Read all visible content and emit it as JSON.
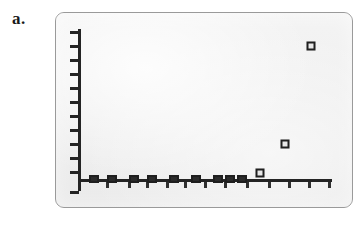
{
  "figure": {
    "panel_label": "a.",
    "background_color": "#ffffff",
    "panel_fill_color": "#ececec",
    "panel_border_color": "#9a9a9a",
    "axis_color": "#242424",
    "marker_color": "#1f1f1f"
  },
  "chart_data": {
    "type": "scatter",
    "title": "",
    "subtitle": "",
    "xlabel": "",
    "ylabel": "",
    "xlim": [
      0,
      10
    ],
    "ylim": [
      0,
      10
    ],
    "grid": false,
    "legend": null,
    "legend_position": "none",
    "x_tick_labels": [],
    "y_tick_labels": [],
    "x_tick_count": 10,
    "y_tick_count": 11,
    "marker_style": "open-square",
    "annotations": [],
    "series": [
      {
        "name": "series-1",
        "x": [
          0.6,
          1.3,
          2.0,
          2.7,
          3.4,
          4.1,
          4.8,
          5.5,
          6.2,
          7.1,
          8.0,
          9.2
        ],
        "y": [
          0.0,
          0.0,
          0.05,
          0.0,
          0.05,
          0.0,
          0.05,
          0.0,
          0.1,
          0.45,
          1.55,
          7.7
        ]
      }
    ],
    "points": [
      {
        "x": 0.6,
        "y": 0.0,
        "px": 38,
        "py": 166,
        "on_axis": true
      },
      {
        "x": 1.3,
        "y": 0.0,
        "px": 56,
        "py": 166,
        "on_axis": true
      },
      {
        "x": 2.0,
        "y": 0.05,
        "px": 78,
        "py": 166,
        "on_axis": true
      },
      {
        "x": 2.7,
        "y": 0.0,
        "px": 96,
        "py": 166,
        "on_axis": true
      },
      {
        "x": 3.4,
        "y": 0.05,
        "px": 118,
        "py": 166,
        "on_axis": true
      },
      {
        "x": 4.1,
        "y": 0.0,
        "px": 140,
        "py": 166,
        "on_axis": true
      },
      {
        "x": 4.8,
        "y": 0.05,
        "px": 162,
        "py": 166,
        "on_axis": true
      },
      {
        "x": 5.5,
        "y": 0.0,
        "px": 174,
        "py": 166,
        "on_axis": true
      },
      {
        "x": 6.2,
        "y": 0.1,
        "px": 186,
        "py": 166,
        "on_axis": true
      },
      {
        "x": 7.1,
        "y": 0.45,
        "px": 204,
        "py": 160,
        "on_axis": false
      },
      {
        "x": 8.0,
        "y": 1.55,
        "px": 229,
        "py": 131,
        "on_axis": false
      },
      {
        "x": 9.2,
        "y": 7.7,
        "px": 255,
        "py": 33,
        "on_axis": false
      }
    ],
    "y_ticks_px": [
      18,
      32,
      46,
      60,
      74,
      88,
      102,
      116,
      130,
      144,
      158,
      178
    ],
    "x_ticks_px": [
      50,
      72,
      90,
      110,
      128,
      148,
      168,
      190,
      212,
      232,
      252,
      272
    ]
  }
}
